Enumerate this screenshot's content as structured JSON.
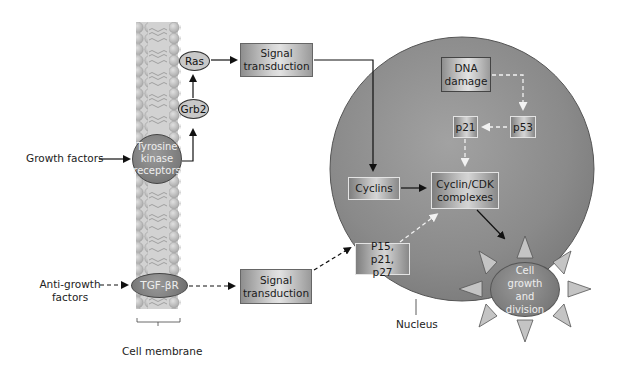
{
  "diagram": {
    "type": "signaling-pathway",
    "membrane": {
      "label": "Cell membrane"
    },
    "inputs": {
      "growth_factors": "Growth factors",
      "anti_growth_factors": "Anti-growth factors"
    },
    "nodes": {
      "tyrosine_kinase": "Tyrosine kinase receptors",
      "grb2": "Grb2",
      "ras": "Ras",
      "signal_transduction_1": "Signal transduction",
      "tgf_beta_r": "TGF-βR",
      "signal_transduction_2": "Signal transduction",
      "dna_damage": "DNA damage",
      "p53": "p53",
      "p21": "p21",
      "cyclins": "Cyclins",
      "cyclin_cdk": "Cyclin/CDK complexes",
      "p15_p21_p27": "P15, p21, p27",
      "cell_growth": "Cell growth and division"
    },
    "labels": {
      "nucleus": "Nucleus"
    },
    "edges": [
      {
        "from": "Growth factors",
        "to": "Tyrosine kinase receptors",
        "style": "solid"
      },
      {
        "from": "Tyrosine kinase receptors",
        "to": "Grb2",
        "style": "solid"
      },
      {
        "from": "Grb2",
        "to": "Ras",
        "style": "solid"
      },
      {
        "from": "Ras",
        "to": "Signal transduction",
        "style": "solid"
      },
      {
        "from": "Signal transduction",
        "to": "Cyclins",
        "style": "solid"
      },
      {
        "from": "Cyclins",
        "to": "Cyclin/CDK complexes",
        "style": "solid"
      },
      {
        "from": "Cyclin/CDK complexes",
        "to": "Cell growth and division",
        "style": "solid"
      },
      {
        "from": "Anti-growth factors",
        "to": "TGF-βR",
        "style": "dashed"
      },
      {
        "from": "TGF-βR",
        "to": "Signal transduction",
        "style": "dashed"
      },
      {
        "from": "Signal transduction",
        "to": "P15, p21, p27",
        "style": "dashed"
      },
      {
        "from": "P15, p21, p27",
        "to": "Cyclin/CDK complexes",
        "style": "dashed"
      },
      {
        "from": "DNA damage",
        "to": "p53",
        "style": "dashed"
      },
      {
        "from": "p53",
        "to": "p21",
        "style": "dashed"
      },
      {
        "from": "p21",
        "to": "Cyclin/CDK complexes",
        "style": "dashed"
      }
    ],
    "colors": {
      "nucleus_fill": "#8c8c8c",
      "membrane_fill": "#c4c4c4",
      "arrow_dark": "#111111",
      "arrow_light": "#f0f0f0"
    }
  }
}
